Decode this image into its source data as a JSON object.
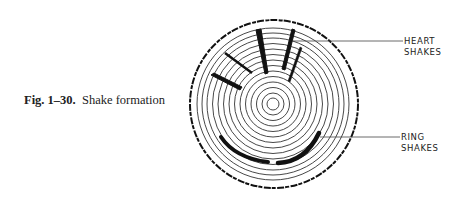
{
  "caption": {
    "number": "Fig. 1–30.",
    "text": "Shake formation"
  },
  "labels": {
    "heart": [
      "HEART",
      "SHAKES"
    ],
    "ring": [
      "RING",
      "SHAKES"
    ]
  },
  "diagram": {
    "center": [
      274,
      104
    ],
    "ring_count": 14,
    "colors": {
      "ink": "#1a1a1a",
      "background": "#ffffff"
    }
  }
}
